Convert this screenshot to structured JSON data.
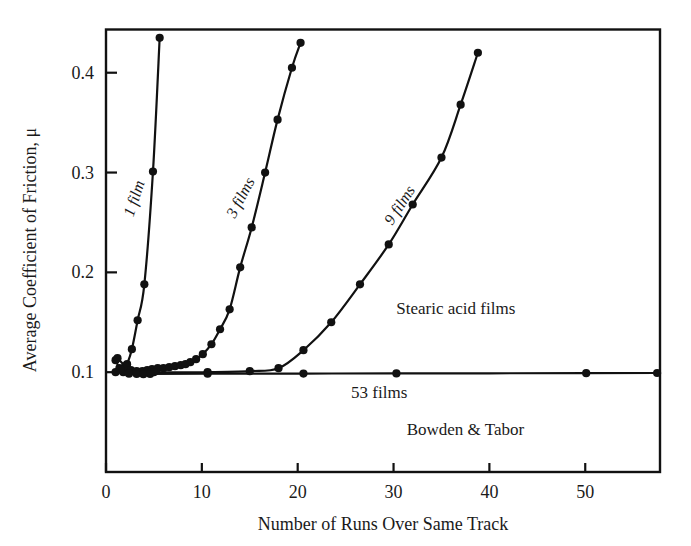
{
  "chart_data": {
    "type": "line",
    "title": "",
    "xlabel": "Number of Runs Over Same Track",
    "ylabel": "Average Coefficient of Friction, μ",
    "xlim": [
      0,
      57.8
    ],
    "ylim": [
      0.0,
      0.4433
    ],
    "xticks": [
      0,
      10,
      20,
      30,
      40,
      50
    ],
    "xtick_labels": [
      "0",
      "10",
      "20",
      "30",
      "40",
      "50"
    ],
    "yticks": [
      0.1,
      0.2,
      0.3,
      0.4
    ],
    "ytick_labels": [
      "0.1",
      "0.2",
      "0.3",
      "0.4"
    ],
    "grid": false,
    "legend": "inline-curve-labels",
    "series": [
      {
        "name": "1 film",
        "label": "1 film",
        "x": [
          1.0,
          1.4,
          1.8,
          2.2,
          2.7,
          3.3,
          4.0,
          4.9,
          5.6
        ],
        "y": [
          0.112,
          0.104,
          0.1,
          0.108,
          0.123,
          0.152,
          0.188,
          0.301,
          0.435
        ]
      },
      {
        "name": "3 films",
        "label": "3 films",
        "x": [
          1.2,
          2.0,
          2.6,
          3.2,
          3.8,
          4.3,
          4.8,
          5.4,
          6.0,
          6.6,
          7.2,
          7.8,
          8.3,
          8.8,
          9.4,
          10.1,
          11.0,
          11.9,
          12.9,
          14.0,
          15.2,
          16.6,
          17.9,
          19.4,
          20.3
        ],
        "y": [
          0.114,
          0.106,
          0.102,
          0.101,
          0.101,
          0.102,
          0.103,
          0.104,
          0.104,
          0.105,
          0.106,
          0.107,
          0.108,
          0.11,
          0.113,
          0.118,
          0.128,
          0.143,
          0.163,
          0.205,
          0.245,
          0.3,
          0.353,
          0.405,
          0.43
        ]
      },
      {
        "name": "9 films",
        "label": "9 films",
        "x": [
          1.5,
          5.0,
          10.6,
          15.0,
          18.0,
          20.6,
          23.5,
          26.5,
          29.5,
          32.0,
          35.0,
          37.0,
          38.8
        ],
        "y": [
          0.103,
          0.1,
          0.1,
          0.101,
          0.104,
          0.122,
          0.15,
          0.188,
          0.228,
          0.268,
          0.315,
          0.368,
          0.42
        ]
      },
      {
        "name": "53 films",
        "label": "53 films",
        "x": [
          1.0,
          2.4,
          3.2,
          3.9,
          4.6,
          10.6,
          20.6,
          30.3,
          50.1,
          57.5
        ],
        "y": [
          0.1,
          0.0985,
          0.0982,
          0.098,
          0.0982,
          0.0985,
          0.0986,
          0.0988,
          0.099,
          0.0992
        ]
      }
    ],
    "annotations": [
      {
        "text": "Stearic acid films",
        "x": 36.5,
        "y": 0.158
      },
      {
        "text": "53 films",
        "x": 28.5,
        "y": 0.0745
      },
      {
        "text": "Bowden & Tabor",
        "x": 37.5,
        "y": 0.0375
      }
    ],
    "curve_labels": [
      {
        "text": "1 film",
        "x_px": 139,
        "y_px": 200,
        "rotate": -72
      },
      {
        "text": "3 films",
        "x_px": 245,
        "y_px": 200,
        "rotate": -62
      },
      {
        "text": "9 films",
        "x_px": 404,
        "y_px": 208,
        "rotate": -57
      }
    ]
  },
  "axis": {
    "y_title": "Average Coefficient of Friction, μ",
    "x_title": "Number of Runs Over Same Track"
  },
  "colors": {
    "ink": "#111111",
    "background": "#ffffff"
  }
}
